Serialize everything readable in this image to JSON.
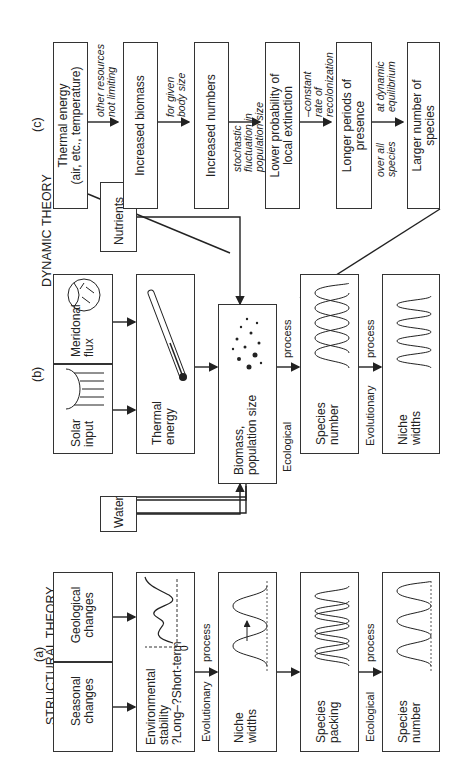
{
  "panels": {
    "a": {
      "tag": "(a)",
      "title": "STRUCTURAL THEORY"
    },
    "b": {
      "tag": "(b)",
      "title": "DYNAMIC THEORY"
    },
    "c": {
      "tag": "(c)"
    }
  },
  "structural": {
    "seasonal": "Seasonal changes",
    "geological": "Geological changes",
    "stability": [
      "Environmental",
      "stability",
      "?Long–?Short-term"
    ],
    "zero_label": "0",
    "evo_process": [
      "Evolutionary",
      "process"
    ],
    "niche": [
      "Niche",
      "widths"
    ],
    "packing": [
      "Species",
      "packing"
    ],
    "eco_process": [
      "Ecological",
      "process"
    ],
    "species_number": [
      "Species",
      "number"
    ]
  },
  "dynamic": {
    "water": "Water",
    "solar": [
      "Solar",
      "input"
    ],
    "meridional": [
      "Meridonal",
      "flux"
    ],
    "nutrients": "Nutrients",
    "thermal": [
      "Thermal",
      "energy"
    ],
    "biomass": [
      "Biomass,",
      "population size"
    ],
    "eco_process": [
      "Ecological",
      "process"
    ],
    "species_number": [
      "Species",
      "number"
    ],
    "evo_process": [
      "Evolutionary",
      "process"
    ],
    "niche": [
      "Niche",
      "widths"
    ]
  },
  "chain": {
    "thermal": [
      "Thermal energy",
      "(air, etc., temperature)"
    ],
    "note1": [
      "other resources",
      "not limiting"
    ],
    "biomass": "Increased biomass",
    "note2": [
      "for given",
      "body size"
    ],
    "numbers": "Increased numbers",
    "note3": [
      "stochastic",
      "fluctuation in",
      "population size"
    ],
    "extinction": [
      "Lower probability of",
      "local extinction"
    ],
    "note4": [
      "–constant",
      "rate of",
      "recolonization"
    ],
    "presence": [
      "Longer periods of",
      "presence"
    ],
    "note5a": [
      "at dynamic",
      "equilibrium"
    ],
    "note5b": [
      "over all",
      "species"
    ],
    "species": [
      "Larger number of",
      "species"
    ]
  }
}
